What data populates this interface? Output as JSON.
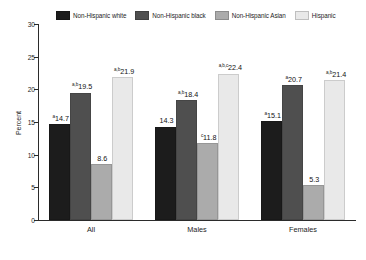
{
  "chart_data": {
    "type": "bar",
    "title": "",
    "xlabel": "",
    "ylabel": "Percent",
    "ylim": [
      0,
      30
    ],
    "yticks": [
      0,
      5,
      10,
      15,
      20,
      25,
      30
    ],
    "grid": false,
    "legend_position": "top",
    "categories": [
      "All",
      "Males",
      "Females"
    ],
    "series": [
      {
        "name": "Non-Hispanic white",
        "color": "#1c1c1c",
        "values": [
          14.7,
          14.3,
          15.1
        ],
        "labels": [
          "14.7",
          "14.3",
          "15.1"
        ],
        "superscripts": [
          "a",
          "",
          "a"
        ]
      },
      {
        "name": "Non-Hispanic black",
        "color": "#4f4f4f",
        "values": [
          19.5,
          18.4,
          20.7
        ],
        "labels": [
          "19.5",
          "18.4",
          "20.7"
        ],
        "superscripts": [
          "a,b",
          "a,b",
          "a"
        ]
      },
      {
        "name": "Non-Hispanic Asian",
        "color": "#ababab",
        "values": [
          8.6,
          11.8,
          5.3
        ],
        "labels": [
          "8.6",
          "11.8",
          "5.3"
        ],
        "superscripts": [
          "",
          "c",
          ""
        ]
      },
      {
        "name": "Hispanic",
        "color": "#e9e9e9",
        "values": [
          21.9,
          22.4,
          21.4
        ],
        "labels": [
          "21.9",
          "22.4",
          "21.4"
        ],
        "superscripts": [
          "a,b",
          "a,b,c",
          "a,b"
        ]
      }
    ]
  }
}
